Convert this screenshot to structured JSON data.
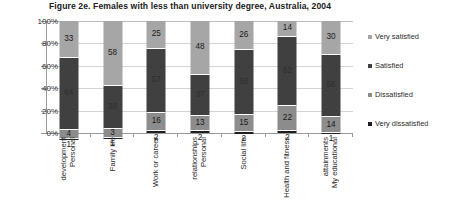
{
  "chart_data": {
    "type": "bar",
    "title": "Figure 2e. Females with less than university degree, Australia, 2004",
    "xlabel": "",
    "ylabel": "",
    "ylim": [
      0,
      100
    ],
    "ytick_labels": [
      "100%",
      "80%",
      "60%",
      "40%",
      "20%",
      "0%"
    ],
    "ytick_values": [
      100,
      80,
      60,
      40,
      20,
      0
    ],
    "grid": true,
    "stacked": true,
    "stack_order_bottom_to_top": [
      "Very dissatisfied",
      "Dissatisfied",
      "Satisfied",
      "Very satisfied"
    ],
    "legend_position": "right",
    "categories": [
      "Personal development",
      "Family life",
      "Work or career",
      "Personal relationships",
      "Social life",
      "Health and fitness",
      "My educational attainments"
    ],
    "series": [
      {
        "name": "Very satisfied",
        "color": "#a6a6a6",
        "values": [
          33,
          58,
          25,
          48,
          26,
          14,
          30
        ]
      },
      {
        "name": "Satisfied",
        "color": "#404040",
        "values": [
          64,
          38,
          57,
          37,
          58,
          62,
          56
        ]
      },
      {
        "name": "Dissatisfied",
        "color": "#8c8c8c",
        "values": [
          4,
          3,
          16,
          13,
          15,
          22,
          14
        ]
      },
      {
        "name": "Very dissatisfied",
        "color": "#1f1f1f",
        "values": [
          1,
          1,
          2,
          2,
          2,
          2,
          1
        ]
      }
    ]
  },
  "axis": {
    "y_labels": [
      "100%",
      "80%",
      "60%",
      "40%",
      "20%",
      "0%"
    ]
  },
  "categories_wrapped": [
    [
      "Personal",
      "development"
    ],
    [
      "Family life"
    ],
    [
      "Work or career"
    ],
    [
      "Personal",
      "relationships"
    ],
    [
      "Social life"
    ],
    [
      "Health and fitness"
    ],
    [
      "My educational",
      "attainments"
    ]
  ],
  "legend": {
    "items": [
      {
        "label": "Very satisfied",
        "key": "vsat"
      },
      {
        "label": "Satisfied",
        "key": "sat"
      },
      {
        "label": "Dissatisfied",
        "key": "dis"
      },
      {
        "label": "Very dissatisfied",
        "key": "vdis"
      }
    ]
  }
}
